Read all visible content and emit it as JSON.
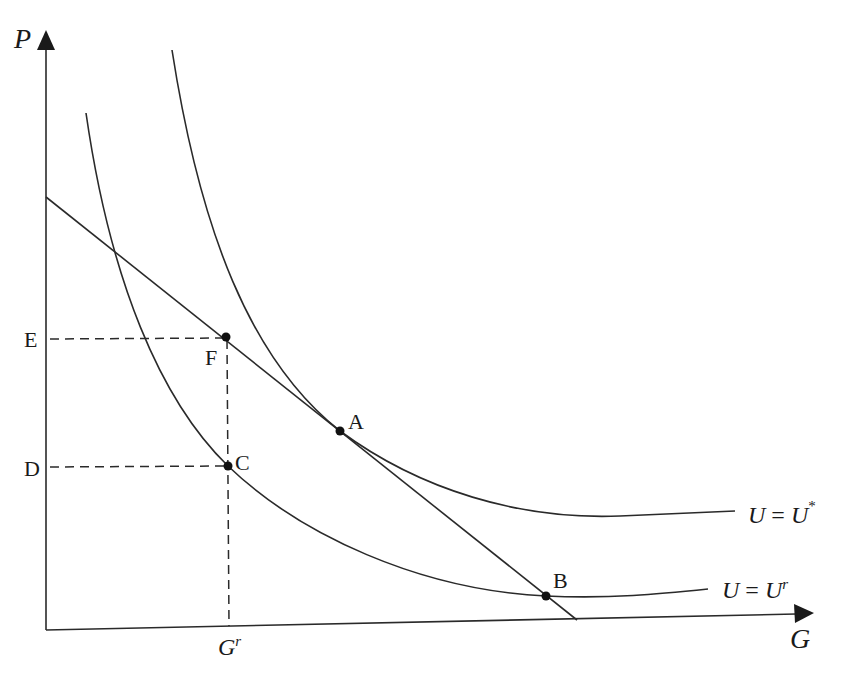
{
  "diagram": {
    "type": "indifference-curve-budget-line",
    "axes": {
      "y_label": "P",
      "x_label": "G",
      "x_tick_label": {
        "main": "G",
        "sup": "r"
      },
      "y_tick_labels": [
        "E",
        "D"
      ]
    },
    "curves": [
      {
        "name": "U-star",
        "label": {
          "lhs": "U",
          "eq": " = ",
          "rhs": "U",
          "sup": "*"
        }
      },
      {
        "name": "U-r",
        "label": {
          "lhs": "U",
          "eq": " = ",
          "rhs": "U",
          "sup": "r"
        }
      }
    ],
    "budget_line": {
      "description": "straight line tangent to U = U* at A"
    },
    "points": {
      "A": "A",
      "B": "B",
      "C": "C",
      "F": "F"
    },
    "colors": {
      "line": "#2a2a2a",
      "background": "#ffffff"
    }
  }
}
